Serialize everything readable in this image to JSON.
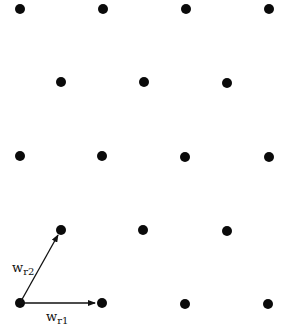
{
  "diagram": {
    "type": "hexagonal-lattice",
    "dot_color": "#0a0a0a",
    "line_color": "#111111",
    "dot_radius": 5,
    "rows": [
      [
        [
          20,
          9
        ],
        [
          103,
          9
        ],
        [
          186,
          9
        ],
        [
          269,
          9
        ]
      ],
      [
        [
          61,
          82
        ],
        [
          144,
          82
        ],
        [
          227,
          83
        ]
      ],
      [
        [
          20,
          156
        ],
        [
          102,
          156
        ],
        [
          185,
          157
        ],
        [
          269,
          157
        ]
      ],
      [
        [
          61,
          230
        ],
        [
          143,
          230
        ],
        [
          227,
          231
        ]
      ],
      [
        [
          20,
          303
        ],
        [
          102,
          303
        ],
        [
          185,
          304
        ],
        [
          268,
          304
        ]
      ]
    ],
    "vectors": [
      {
        "name": "w_r1",
        "from": [
          20,
          303
        ],
        "to": [
          95,
          303
        ],
        "label": "w",
        "subscript": "r1",
        "label_pos": [
          46,
          321
        ]
      },
      {
        "name": "w_r2",
        "from": [
          20,
          303
        ],
        "to": [
          58,
          235
        ],
        "label": "w",
        "subscript": "r2",
        "label_pos": [
          12,
          272
        ]
      }
    ]
  }
}
